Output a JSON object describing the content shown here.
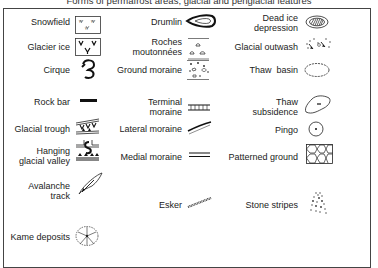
{
  "title": "Forms of permafrost areas, glacial and periglacial features",
  "columns": [
    {
      "items": [
        {
          "label": "Snowfield",
          "icon": "snowfield-icon"
        },
        {
          "label": "Glacier ice",
          "icon": "glacier-ice-icon"
        },
        {
          "label": "Cirque",
          "icon": "cirque-icon"
        },
        {
          "label": "Rock bar",
          "icon": "rock-bar-icon"
        },
        {
          "label": "Glacial trough",
          "icon": "glacial-trough-icon"
        },
        {
          "label_line1": "Hanging",
          "label_line2": "glacial valley",
          "icon": "hanging-glacial-valley-icon"
        },
        {
          "label_line1": "Avalanche",
          "label_line2": "track",
          "icon": "avalanche-track-icon"
        },
        {
          "label": "Kame deposits",
          "icon": "kame-deposits-icon"
        }
      ]
    },
    {
      "items": [
        {
          "label": "Drumlin",
          "icon": "drumlin-icon"
        },
        {
          "label_line1": "Roches",
          "label_line2": "moutonnées",
          "icon": "roches-moutonnees-icon"
        },
        {
          "label": "Ground moraine",
          "icon": "ground-moraine-icon"
        },
        {
          "label_line1": "Terminal",
          "label_line2": "moraine",
          "icon": "terminal-moraine-icon"
        },
        {
          "label": "Lateral moraine",
          "icon": "lateral-moraine-icon"
        },
        {
          "label": "Medial moraine",
          "icon": "medial-moraine-icon"
        },
        {
          "label": "Esker",
          "icon": "esker-icon"
        }
      ]
    },
    {
      "items": [
        {
          "label_line1": "Dead ice",
          "label_line2": "depression",
          "icon": "dead-ice-depression-icon"
        },
        {
          "label": "Glacial outwash",
          "icon": "glacial-outwash-icon"
        },
        {
          "label": "Thaw  basin",
          "icon": "thaw-basin-icon"
        },
        {
          "label_line1": "Thaw",
          "label_line2": "subsidence",
          "icon": "thaw-subsidence-icon"
        },
        {
          "label": "Pingo",
          "icon": "pingo-icon"
        },
        {
          "label": "Patterned ground",
          "icon": "patterned-ground-icon"
        },
        {
          "label": "Stone stripes",
          "icon": "stone-stripes-icon"
        }
      ]
    }
  ]
}
